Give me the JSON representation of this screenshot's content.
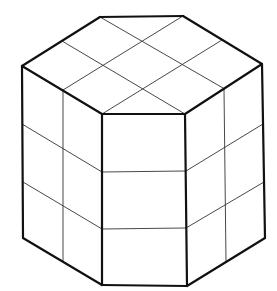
{
  "diagram": {
    "type": "isometric-prism",
    "colors": {
      "background": "#ffffff",
      "outline": "#111111",
      "grid": "#333333"
    },
    "stroke": {
      "outline_width": 2.2,
      "grid_width": 0.9
    },
    "vertices": {
      "top_back_left": [
        100,
        17
      ],
      "top_back_right": [
        183,
        16
      ],
      "top_right": [
        262,
        64
      ],
      "top_front_right": [
        185,
        114
      ],
      "top_front_left": [
        102,
        114
      ],
      "top_left": [
        22,
        66
      ],
      "bottom_left": [
        23,
        238
      ],
      "bottom_front_left": [
        102,
        285
      ],
      "bottom_front_right": [
        187,
        286
      ],
      "bottom_right": [
        265,
        238
      ]
    },
    "top_face_grid_lines": [
      [
        [
          100,
          17
        ],
        [
          223,
          88
        ]
      ],
      [
        [
          62,
          41
        ],
        [
          185,
          114
        ]
      ],
      [
        [
          183,
          16
        ],
        [
          63,
          90
        ]
      ],
      [
        [
          222,
          40
        ],
        [
          102,
          114
        ]
      ]
    ],
    "left_face": {
      "vertical_divider": [
        [
          63,
          90
        ],
        [
          63,
          261
        ]
      ],
      "horizontal_dividers": [
        [
          [
            22,
            124
          ],
          [
            102,
            172
          ]
        ],
        [
          [
            23,
            182
          ],
          [
            102,
            229
          ]
        ]
      ]
    },
    "front_face": {
      "horizontal_dividers": [
        [
          [
            102,
            172
          ],
          [
            186,
            171
          ]
        ],
        [
          [
            102,
            229
          ],
          [
            186,
            228
          ]
        ]
      ]
    },
    "right_face": {
      "vertical_divider": [
        [
          224,
          88
        ],
        [
          226,
          262
        ]
      ],
      "horizontal_dividers": [
        [
          [
            186,
            171
          ],
          [
            263,
            124
          ]
        ],
        [
          [
            186,
            228
          ],
          [
            264,
            182
          ]
        ]
      ]
    }
  }
}
